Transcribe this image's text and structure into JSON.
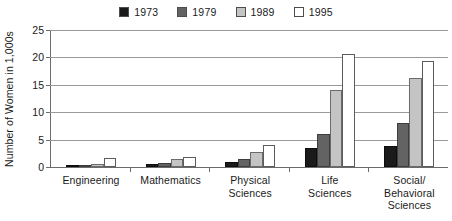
{
  "chart_data": {
    "type": "bar",
    "title": "",
    "subtitle": "",
    "xlabel": "",
    "ylabel": "Number of Women in 1,000s",
    "ylim": [
      0,
      25
    ],
    "yticks": [
      0,
      5,
      10,
      15,
      20,
      25
    ],
    "ytick_labels": [
      "0",
      "5",
      "10",
      "15",
      "20",
      "25"
    ],
    "grid": true,
    "grid_orientation": "horizontal",
    "legend_position": "top-center",
    "categories": [
      "Engineering",
      "Mathematics",
      "Physical Sciences",
      "Life Sciences",
      "Social/Behavioral Sciences"
    ],
    "category_label_lines": [
      [
        "Engineering"
      ],
      [
        "Mathematics"
      ],
      [
        "Physical",
        "Sciences"
      ],
      [
        "Life",
        "Sciences"
      ],
      [
        "Social/",
        "Behavioral",
        "Sciences"
      ]
    ],
    "series": [
      {
        "name": "1973",
        "color": "#1a1a1a",
        "values": [
          0.1,
          0.6,
          1.0,
          3.4,
          3.8
        ]
      },
      {
        "name": "1979",
        "color": "#636363",
        "values": [
          0.25,
          0.8,
          1.4,
          6.0,
          8.0
        ]
      },
      {
        "name": "1989",
        "color": "#c4c4c4",
        "values": [
          0.6,
          1.5,
          2.8,
          14.1,
          16.2
        ]
      },
      {
        "name": "1995",
        "color": "#ffffff",
        "values": [
          1.6,
          1.9,
          4.1,
          20.6,
          19.3
        ]
      }
    ]
  },
  "legend": {
    "entries": [
      {
        "label": "1973",
        "color": "#1a1a1a"
      },
      {
        "label": "1979",
        "color": "#636363"
      },
      {
        "label": "1989",
        "color": "#c4c4c4"
      },
      {
        "label": "1995",
        "color": "#ffffff"
      }
    ]
  }
}
